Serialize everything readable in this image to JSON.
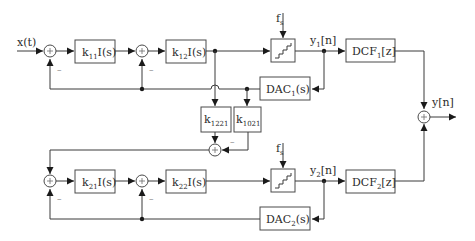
{
  "diagram": {
    "input_label": "x(t)",
    "output_label": "y[n]",
    "stage1": {
      "k11_label": "k",
      "k11_sub": "11",
      "k11_tail": "I(s)",
      "k12_label": "k",
      "k12_sub": "12",
      "k12_tail": "I(s)",
      "fs_label": "f",
      "fs_sub": "s",
      "y_label": "y",
      "y_sub": "1",
      "y_tail": "[n]",
      "dcf_label": "DCF",
      "dcf_sub": "1",
      "dcf_tail": "[z]",
      "dac_label": "DAC",
      "dac_sub": "1",
      "dac_tail": "(s)"
    },
    "coupling": {
      "k1221_label": "k",
      "k1221_sub": "1221",
      "k1021_label": "k",
      "k1021_sub": "1021"
    },
    "stage2": {
      "k21_label": "k",
      "k21_sub": "21",
      "k21_tail": "I(s)",
      "k22_label": "k",
      "k22_sub": "22",
      "k22_tail": "I(s)",
      "fs_label": "f",
      "fs_sub": "s",
      "y_label": "y",
      "y_sub": "2",
      "y_tail": "[n]",
      "dcf_label": "DCF",
      "dcf_sub": "2",
      "dcf_tail": "[z]",
      "dac_label": "DAC",
      "dac_sub": "2",
      "dac_tail": "(s)"
    },
    "minus_sign": "–",
    "plus_sign": "+"
  }
}
